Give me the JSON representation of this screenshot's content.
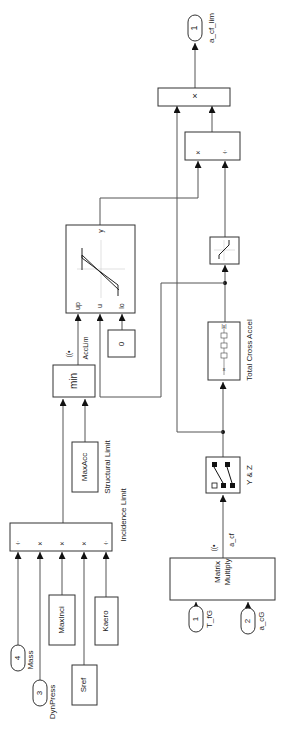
{
  "diagram": {
    "type": "simulink-block-diagram",
    "orientation": "rotated-90-ccw",
    "outports": [
      {
        "id": "out1",
        "number": "1",
        "label": "a_cf_lim"
      }
    ],
    "inports": [
      {
        "id": "in1",
        "number": "1",
        "label": "T_fG"
      },
      {
        "id": "in2",
        "number": "2",
        "label": "a_cG"
      },
      {
        "id": "in3",
        "number": "3",
        "label": "DynPress"
      },
      {
        "id": "in4",
        "number": "4",
        "label": "Mass"
      }
    ],
    "constants": [
      {
        "id": "maxinci",
        "value": "MaxInci"
      },
      {
        "id": "sref",
        "value": "Sref"
      },
      {
        "id": "kaero",
        "value": "Kaero"
      },
      {
        "id": "maxacc",
        "value": "MaxAcc"
      },
      {
        "id": "zero",
        "value": "0"
      }
    ],
    "blocks": {
      "final_product": {
        "op": "×"
      },
      "divide": {
        "ops": [
          "×",
          "÷"
        ]
      },
      "incidence_limit": {
        "ops": [
          "÷",
          "×",
          "×",
          "×",
          "÷"
        ],
        "label": "Incidence Limit"
      },
      "structural_limit": {
        "label": "Structural Limit"
      },
      "min_block": {
        "label": "min"
      },
      "sat_dynamic": {
        "ports": [
          "up",
          "u",
          "lo"
        ],
        "out": "y"
      },
      "matrix_multiply": {
        "line1": "Matrix",
        "line2": "Multiply"
      },
      "selector": {
        "label": "Y & Z"
      },
      "total_cross_accel": {
        "label": "Total Cross Accel"
      }
    },
    "signals": [
      {
        "name": "a_cf",
        "logged": "((•"
      },
      {
        "name": "AccLim",
        "logged": "((•"
      }
    ]
  }
}
